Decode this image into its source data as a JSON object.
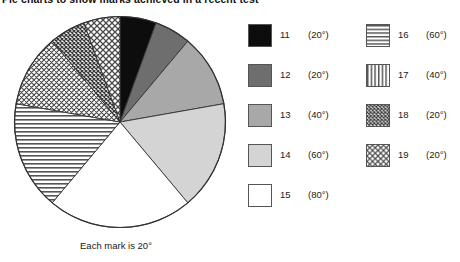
{
  "title": "Pie charts to show marks achieved in a recent test",
  "caption": "Each mark is 20°",
  "chart_data": {
    "type": "pie",
    "title": "Pie charts to show marks achieved in a recent test",
    "caption": "Each mark is 20°",
    "units": "degrees",
    "degrees_per_mark": 20,
    "total_degrees": 360,
    "start_angle_deg": 0,
    "direction": "clockwise",
    "legend_position": "right",
    "categories": [
      "11",
      "12",
      "13",
      "14",
      "15",
      "16",
      "17",
      "18",
      "19"
    ],
    "values": [
      20,
      20,
      40,
      60,
      80,
      60,
      40,
      20,
      20
    ],
    "xlabel": "",
    "ylabel": "",
    "slices": [
      {
        "label": "11",
        "angle_text": "(20°)",
        "degrees": 20,
        "marks": 1,
        "fill": "solid-black",
        "color": "#0d0d0d"
      },
      {
        "label": "12",
        "angle_text": "(20°)",
        "degrees": 20,
        "marks": 1,
        "fill": "solid-dark-gray",
        "color": "#6e6e6e"
      },
      {
        "label": "13",
        "angle_text": "(40°)",
        "degrees": 40,
        "marks": 2,
        "fill": "solid-mid-gray",
        "color": "#a8a8a8"
      },
      {
        "label": "14",
        "angle_text": "(60°)",
        "degrees": 60,
        "marks": 3,
        "fill": "solid-light-gray",
        "color": "#d4d4d4"
      },
      {
        "label": "15",
        "angle_text": "(80°)",
        "degrees": 80,
        "marks": 4,
        "fill": "solid-white",
        "color": "#ffffff"
      },
      {
        "label": "16",
        "angle_text": "(60°)",
        "degrees": 60,
        "marks": 3,
        "fill": "horizontal-lines",
        "color": "#ffffff"
      },
      {
        "label": "17",
        "angle_text": "(40°)",
        "degrees": 40,
        "marks": 2,
        "fill": "diagonal-hatch",
        "color": "#ffffff"
      },
      {
        "label": "18",
        "angle_text": "(20°)",
        "degrees": 20,
        "marks": 1,
        "fill": "cross-hatch-dense",
        "color": "#ffffff"
      },
      {
        "label": "19",
        "angle_text": "(20°)",
        "degrees": 20,
        "marks": 1,
        "fill": "cross-hatch-light",
        "color": "#ffffff"
      }
    ]
  },
  "legend": {
    "left_column": [
      {
        "label": "11",
        "angle_text": "(20°)",
        "fill": "solid-black"
      },
      {
        "label": "12",
        "angle_text": "(20°)",
        "fill": "solid-dark-gray"
      },
      {
        "label": "13",
        "angle_text": "(40°)",
        "fill": "solid-mid-gray"
      },
      {
        "label": "14",
        "angle_text": "(60°)",
        "fill": "solid-light-gray"
      },
      {
        "label": "15",
        "angle_text": "(80°)",
        "fill": "solid-white"
      }
    ],
    "right_column": [
      {
        "label": "16",
        "angle_text": "(60°)",
        "fill": "horizontal-lines"
      },
      {
        "label": "17",
        "angle_text": "(40°)",
        "fill": "vertical-lines"
      },
      {
        "label": "18",
        "angle_text": "(20°)",
        "fill": "cross-hatch-dense"
      },
      {
        "label": "19",
        "angle_text": "(20°)",
        "fill": "cross-hatch-light"
      }
    ]
  }
}
